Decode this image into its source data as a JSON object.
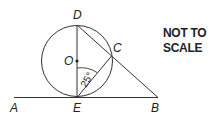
{
  "diagram": {
    "note": {
      "line1": "NOT TO",
      "line2": "SCALE"
    },
    "labels": {
      "A": "A",
      "B": "B",
      "C": "C",
      "D": "D",
      "E": "E",
      "O": "O"
    },
    "angle": {
      "label": "25°",
      "value": 25,
      "at": "E",
      "between": [
        "OE",
        "EC"
      ]
    },
    "stroke_color": "#333333",
    "elements": [
      "circle centre O",
      "diameter DE",
      "tangent AB at E",
      "line DCB",
      "chord EC"
    ]
  }
}
